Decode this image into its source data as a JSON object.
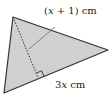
{
  "diagram": {
    "type": "triangle",
    "fill_color": "#d0d0d0",
    "stroke_color": "#333333",
    "vertices": {
      "top": [
        13,
        17
      ],
      "right": [
        108,
        50
      ],
      "bottom_left": [
        4,
        93
      ]
    },
    "altitude_foot": [
      38.5,
      78.7
    ],
    "labels": {
      "height": "(x + 1) cm",
      "height_var": "x",
      "height_rest_open": "(",
      "height_rest_close": " + 1) cm",
      "base": "3x cm",
      "base_coef": "3",
      "base_var": "x",
      "base_unit": " cm"
    },
    "right_angle_marker": true
  }
}
